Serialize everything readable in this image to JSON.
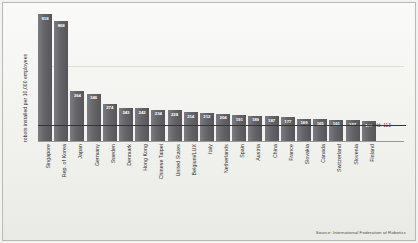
{
  "chart_data": {
    "type": "bar",
    "title": "",
    "subtitle": "",
    "xlabel": "",
    "ylabel": "robots installed per 10,000 employees",
    "ylim": [
      0,
      950
    ],
    "grid": false,
    "legend": "none",
    "categories": [
      "Singapore",
      "Rep. of Korea",
      "Japan",
      "Germany",
      "Sweden",
      "Denmark",
      "Hong Kong",
      "Chinese Taipei",
      "United States",
      "Belgium/LUX",
      "Italy",
      "Netherlands",
      "Spain",
      "Austria",
      "China",
      "France",
      "Slovakia",
      "Canada",
      "Switzerland",
      "Slovenia",
      "Finland"
    ],
    "values": [
      918,
      868,
      364,
      346,
      274,
      243,
      242,
      234,
      228,
      214,
      212,
      204,
      191,
      189,
      187,
      177,
      169,
      165,
      161,
      157,
      149
    ],
    "reference_line": {
      "label": "World: 113",
      "value": 113
    },
    "source": "Source: International Federation of Robotics"
  },
  "figure": {
    "source_note": "Source: International Federation of Robotics",
    "y_axis_title": "robots installed per 10,000 employees",
    "world_reference_label": "World: 113"
  }
}
